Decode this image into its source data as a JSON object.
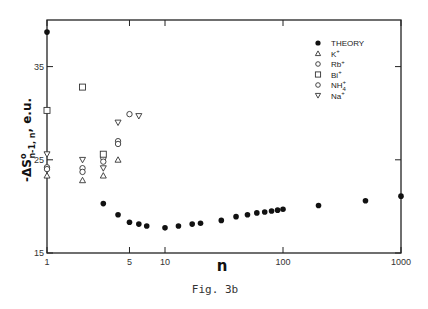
{
  "figure": {
    "caption": "Fig. 3b"
  },
  "chart_data": {
    "type": "scatter",
    "title": "",
    "xlabel": "n",
    "ylabel": "-ΔS°n-1, n, e.u.",
    "ylabel_parts": {
      "main": "-ΔS",
      "sup": "o",
      "sub": "n-1, n",
      "tail": ", e.u."
    },
    "xscale": "log",
    "xlim": [
      1,
      1000
    ],
    "ylim": [
      15,
      40
    ],
    "grid": false,
    "legend_position": "upper right",
    "x_ticks": [
      {
        "value": 1,
        "label": "1"
      },
      {
        "value": 5,
        "label": "5"
      },
      {
        "value": 10,
        "label": "10"
      },
      {
        "value": 100,
        "label": "100"
      },
      {
        "value": 1000,
        "label": "1000"
      }
    ],
    "y_ticks": [
      {
        "value": 15,
        "label": "15"
      },
      {
        "value": 25,
        "label": "25"
      },
      {
        "value": 35,
        "label": "35"
      }
    ],
    "series": [
      {
        "name": "THEORY",
        "marker": "filled-circle",
        "x": [
          1,
          3,
          4,
          5,
          6,
          7,
          10,
          13,
          17,
          20,
          30,
          40,
          50,
          60,
          70,
          80,
          90,
          100,
          200,
          500,
          1000
        ],
        "y": [
          38.7,
          20.3,
          19.1,
          18.3,
          18.1,
          17.9,
          17.7,
          17.9,
          18.1,
          18.2,
          18.5,
          18.9,
          19.1,
          19.3,
          19.4,
          19.5,
          19.6,
          19.7,
          20.1,
          20.6,
          21.1
        ]
      },
      {
        "name": "K+",
        "label_base": "K",
        "label_sup": "+",
        "label_sub": "",
        "marker": "open-triangle-up",
        "x": [
          1,
          2,
          3,
          4
        ],
        "y": [
          23.3,
          22.8,
          23.3,
          25.0
        ]
      },
      {
        "name": "Rb+",
        "label_base": "Rb",
        "label_sup": "+",
        "label_sub": "",
        "marker": "open-circle",
        "x": [
          1,
          2,
          3,
          4
        ],
        "y": [
          24.2,
          24.1,
          25.2,
          27.0
        ]
      },
      {
        "name": "Bi+",
        "label_base": "Bi",
        "label_sup": "+",
        "label_sub": "",
        "marker": "open-square",
        "x": [
          1,
          2,
          3
        ],
        "y": [
          30.3,
          32.8,
          25.6
        ]
      },
      {
        "name": "NH4+",
        "label_base": "NH",
        "label_sup": "+",
        "label_sub": "4",
        "marker": "open-circle",
        "x": [
          1,
          2,
          3,
          4,
          5
        ],
        "y": [
          24.0,
          23.7,
          24.8,
          26.7,
          29.9
        ]
      },
      {
        "name": "Na+",
        "label_base": "Na",
        "label_sup": "+",
        "label_sub": "",
        "marker": "open-triangle-down",
        "x": [
          1,
          2,
          3,
          4,
          6
        ],
        "y": [
          25.6,
          25.0,
          24.1,
          29.0,
          29.7
        ]
      }
    ]
  }
}
